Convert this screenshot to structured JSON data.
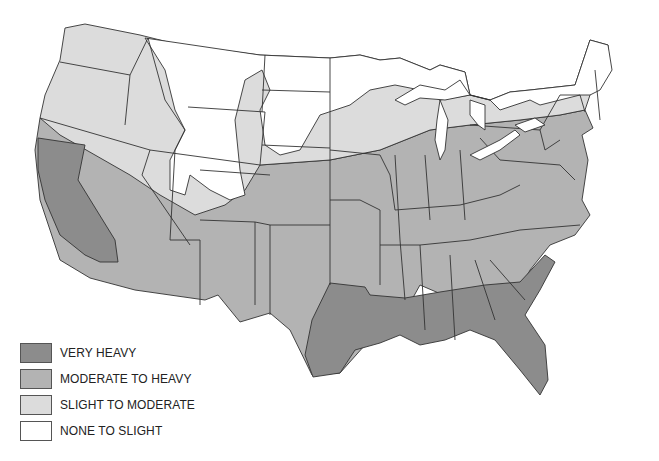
{
  "map": {
    "subject": "Contiguous United States",
    "legend": [
      {
        "label": "VERY HEAVY",
        "color": "#8c8c8c"
      },
      {
        "label": "MODERATE TO HEAVY",
        "color": "#b3b3b3"
      },
      {
        "label": "SLIGHT TO MODERATE",
        "color": "#dcdcdc"
      },
      {
        "label": "NONE TO SLIGHT",
        "color": "#ffffff"
      }
    ],
    "zones": {
      "very_heavy": [
        "California",
        "Texas (east)",
        "Louisiana",
        "Mississippi",
        "Alabama",
        "Georgia",
        "South Carolina",
        "Florida"
      ],
      "moderate_to_heavy": [
        "Nevada",
        "Arizona",
        "New Mexico",
        "Texas (west)",
        "Utah (south)",
        "Colorado (south)",
        "Kansas",
        "Oklahoma",
        "Missouri",
        "Arkansas",
        "Iowa",
        "Illinois",
        "Indiana",
        "Ohio",
        "Kentucky",
        "Tennessee",
        "West Virginia",
        "Virginia",
        "North Carolina",
        "Pennsylvania",
        "New Jersey",
        "Maryland",
        "Delaware",
        "New York (south)",
        "Connecticut",
        "Rhode Island",
        "Massachusetts (south)",
        "Nebraska (south)",
        "Oregon (south strip)"
      ],
      "slight_to_moderate": [
        "Washington",
        "Oregon",
        "Idaho",
        "Montana (west)",
        "Utah (north)",
        "Nevada (north)",
        "Wisconsin",
        "Michigan",
        "Minnesota (south)",
        "Nebraska (north)",
        "New York (north)",
        "Vermont (south)",
        "New Hampshire (south)"
      ],
      "none_to_slight": [
        "Montana",
        "Wyoming",
        "North Dakota",
        "South Dakota",
        "Minnesota (north)",
        "Maine",
        "Vermont",
        "New Hampshire"
      ]
    }
  }
}
